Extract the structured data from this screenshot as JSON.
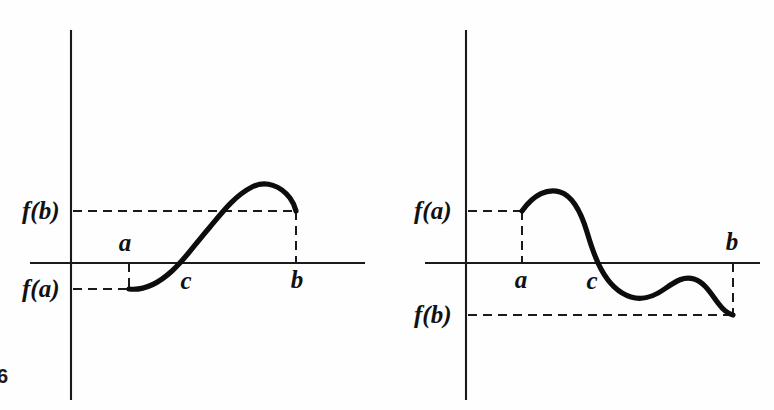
{
  "figure": {
    "number_label": "6",
    "background_color": "#fefefe",
    "ink_color": "#111111"
  },
  "panels": [
    {
      "id": "left",
      "description": "Increasing continuous function with f(a) negative and f(b) positive, crossing zero at c",
      "labels": {
        "f_of_a": "f(a)",
        "f_of_b": "f(b)",
        "point_a": "a",
        "point_b": "b",
        "point_c": "c"
      },
      "geometry": {
        "y_axis_x": 71,
        "y_axis_top": 30,
        "y_axis_bottom": 400,
        "x_axis_y": 263,
        "x_axis_left": 30,
        "x_axis_right": 365,
        "a_x": 129,
        "b_x": 296,
        "c_x": 180,
        "fa_y": 289,
        "fb_y": 211
      },
      "curve_path": "M 129,289 C 146,291 160,282 172,271 C 186,258 196,243 210,227 C 224,210 236,195 252,187 C 266,180 281,186 290,198 C 293,202 295,207 296,211",
      "dashed_segments": [
        "M 73,211 L 296,211",
        "M 73,289 L 129,289",
        "M 129,263 L 129,289",
        "M 296,211 L 296,263"
      ],
      "label_positions": {
        "f_of_b": {
          "x": 22,
          "y": 219,
          "anchor": "start"
        },
        "f_of_a": {
          "x": 22,
          "y": 297,
          "anchor": "start"
        },
        "a": {
          "x": 125,
          "y": 251,
          "anchor": "middle"
        },
        "b": {
          "x": 297,
          "y": 288,
          "anchor": "middle"
        },
        "c": {
          "x": 186,
          "y": 289,
          "anchor": "middle"
        }
      }
    },
    {
      "id": "right",
      "description": "Continuous function with f(a) positive and f(b) negative, crossing zero at c, with an intermediate bump below the axis",
      "labels": {
        "f_of_a": "f(a)",
        "f_of_b": "f(b)",
        "point_a": "a",
        "point_b": "b",
        "point_c": "c"
      },
      "geometry": {
        "y_axis_x": 466,
        "y_axis_top": 30,
        "y_axis_bottom": 400,
        "x_axis_y": 263,
        "x_axis_left": 425,
        "x_axis_right": 760,
        "a_x": 522,
        "b_x": 733,
        "c_x": 598,
        "fa_y": 211,
        "fb_y": 315
      },
      "curve_path": "M 522,211 C 534,194 548,188 560,192 C 573,196 581,212 587,232 C 592,249 595,258 601,269 C 608,282 618,293 631,297 C 644,301 655,296 666,288 C 676,281 684,276 694,279 C 704,282 710,292 718,303 C 724,311 728,314 733,315",
      "dashed_segments": [
        "M 468,211 L 522,211",
        "M 468,315 L 733,315",
        "M 522,211 L 522,263",
        "M 733,263 L 733,315"
      ],
      "label_positions": {
        "f_of_a": {
          "x": 414,
          "y": 219,
          "anchor": "start"
        },
        "f_of_b": {
          "x": 414,
          "y": 323,
          "anchor": "start"
        },
        "a": {
          "x": 521,
          "y": 288,
          "anchor": "middle"
        },
        "b": {
          "x": 732,
          "y": 250,
          "anchor": "middle"
        },
        "c": {
          "x": 592,
          "y": 289,
          "anchor": "middle"
        }
      }
    }
  ],
  "chart_data": {
    "type": "line",
    "title": "",
    "xlabel": "",
    "ylabel": "",
    "series": [
      {
        "name": "left-panel-curve",
        "comment": "f(a) < 0 < f(b); single crossing at c, increasing then turning over near b",
        "points": [
          {
            "x": "a",
            "y": "f(a)",
            "note": "start, below axis"
          },
          {
            "x": "c",
            "y": 0,
            "note": "zero crossing"
          },
          {
            "x": "peak",
            "y": "max",
            "note": "local maximum above f(b)"
          },
          {
            "x": "b",
            "y": "f(b)",
            "note": "end, above axis"
          }
        ]
      },
      {
        "name": "right-panel-curve",
        "comment": "f(a) > 0 > f(b); single crossing at c, with a local minimum and a bump below the axis",
        "points": [
          {
            "x": "a",
            "y": "f(a)",
            "note": "start, above axis"
          },
          {
            "x": "peak",
            "y": "max",
            "note": "local maximum above f(a)"
          },
          {
            "x": "c",
            "y": 0,
            "note": "zero crossing"
          },
          {
            "x": "trough1",
            "y": "min",
            "note": "local minimum below axis"
          },
          {
            "x": "bump",
            "y": "local max",
            "note": "local maximum still below axis"
          },
          {
            "x": "b",
            "y": "f(b)",
            "note": "end, below axis"
          }
        ]
      }
    ],
    "legend_position": "none",
    "grid": false
  }
}
